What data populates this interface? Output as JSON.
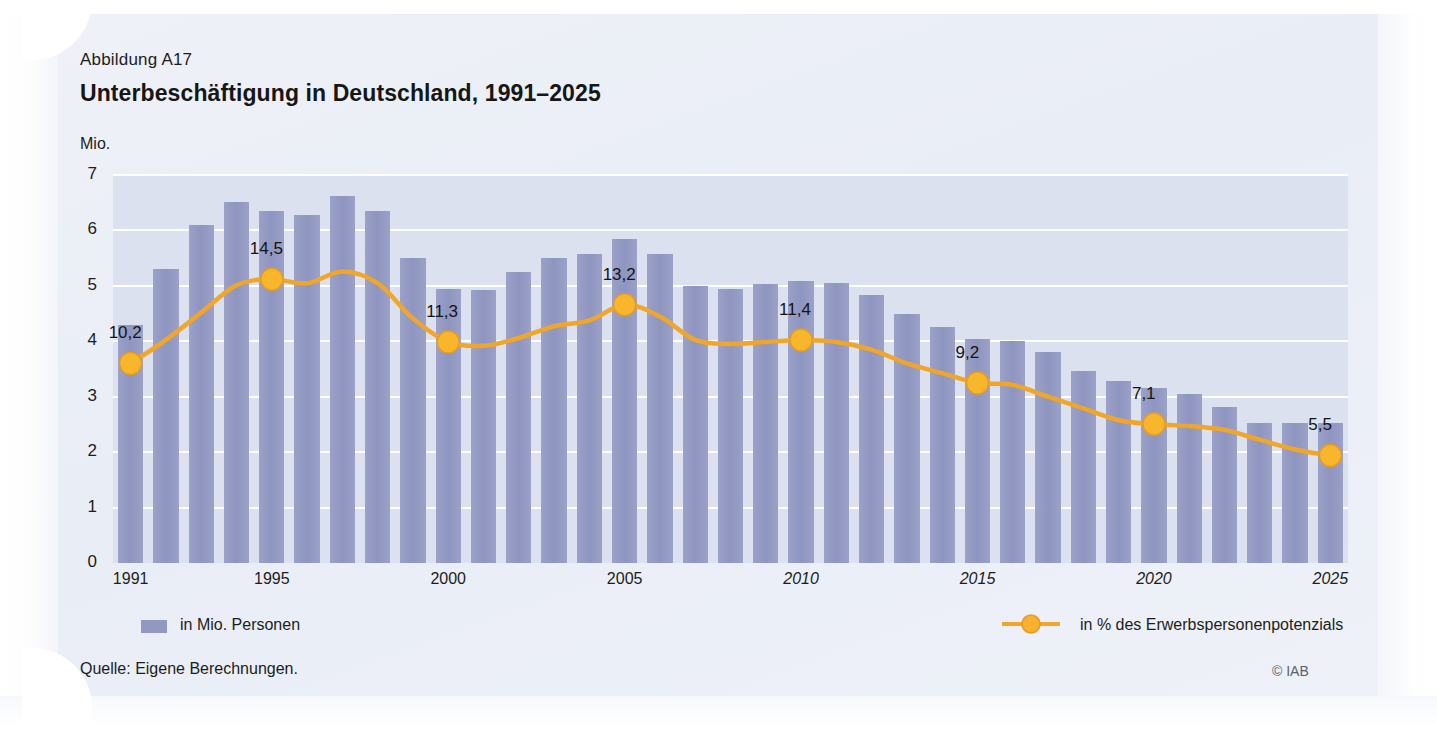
{
  "figure": {
    "number": "Abbildung A17",
    "title": "Unterbeschäftigung in Deutschland, 1991–2025",
    "unit": "Mio.",
    "source": "Quelle: Eigene Berechnungen.",
    "copyright": "© IAB"
  },
  "legend": {
    "bars_label": "in Mio. Personen",
    "line_label": "in % des Erwerbspersonenpotenzials",
    "bars_color": "#9198c2",
    "line_color": "#f0a52b"
  },
  "chart_data": {
    "type": "bar",
    "title": "Unterbeschäftigung in Deutschland, 1991–2025",
    "xlabel": "",
    "ylabel": "Mio.",
    "ylim": [
      0,
      7
    ],
    "yticks": [
      "0",
      "1",
      "2",
      "3",
      "4",
      "5",
      "6",
      "7"
    ],
    "grid": true,
    "legend_position": "bottom",
    "categories": [
      "1991",
      "1992",
      "1993",
      "1994",
      "1995",
      "1996",
      "1997",
      "1998",
      "1999",
      "2000",
      "2001",
      "2002",
      "2003",
      "2004",
      "2005",
      "2006",
      "2007",
      "2008",
      "2009",
      "2010",
      "2011",
      "2012",
      "2013",
      "2014",
      "2015",
      "2016",
      "2017",
      "2018",
      "2019",
      "2020",
      "2021",
      "2022",
      "2023",
      "2024",
      "2025"
    ],
    "xtick_labels": [
      {
        "category": "1991",
        "text": "1991",
        "italic": false
      },
      {
        "category": "1995",
        "text": "1995",
        "italic": false
      },
      {
        "category": "2000",
        "text": "2000",
        "italic": false
      },
      {
        "category": "2005",
        "text": "2005",
        "italic": false
      },
      {
        "category": "2010",
        "text": "2010",
        "italic": true
      },
      {
        "category": "2015",
        "text": "2015",
        "italic": true
      },
      {
        "category": "2020",
        "text": "2020",
        "italic": true
      },
      {
        "category": "2025",
        "text": "2025",
        "italic": true
      }
    ],
    "series": [
      {
        "name": "in Mio. Personen",
        "type": "bar",
        "unit": "Mio.",
        "axis": "left",
        "values": [
          4.3,
          5.3,
          6.1,
          6.52,
          6.35,
          6.27,
          6.62,
          6.35,
          5.5,
          4.95,
          4.93,
          5.25,
          5.5,
          5.58,
          5.85,
          5.58,
          5.0,
          4.95,
          5.03,
          5.08,
          5.05,
          4.83,
          4.5,
          4.25,
          4.05,
          4.0,
          3.8,
          3.47,
          3.28,
          3.15,
          3.05,
          2.82,
          2.52,
          2.52,
          2.52
        ]
      },
      {
        "name": "in % des Erwerbspersonenpotenzials",
        "type": "line",
        "unit": "%",
        "axis": "right",
        "values": [
          10.2,
          11.4,
          12.8,
          14.2,
          14.5,
          14.3,
          14.9,
          14.3,
          12.5,
          11.3,
          11.1,
          11.5,
          12.1,
          12.4,
          13.2,
          12.6,
          11.4,
          11.2,
          11.3,
          11.4,
          11.3,
          10.9,
          10.2,
          9.7,
          9.2,
          9.1,
          8.5,
          7.9,
          7.3,
          7.1,
          7.0,
          6.8,
          6.3,
          5.8,
          5.5
        ],
        "labeled_points": [
          {
            "category": "1991",
            "value": 10.2,
            "label": "10,2"
          },
          {
            "category": "1995",
            "value": 14.5,
            "label": "14,5"
          },
          {
            "category": "2000",
            "value": 11.3,
            "label": "11,3"
          },
          {
            "category": "2005",
            "value": 13.2,
            "label": "13,2"
          },
          {
            "category": "2010",
            "value": 11.4,
            "label": "11,4"
          },
          {
            "category": "2015",
            "value": 9.2,
            "label": "9,2"
          },
          {
            "category": "2020",
            "value": 7.1,
            "label": "7,1"
          },
          {
            "category": "2025",
            "value": 5.5,
            "label": "5,5"
          }
        ]
      }
    ]
  }
}
